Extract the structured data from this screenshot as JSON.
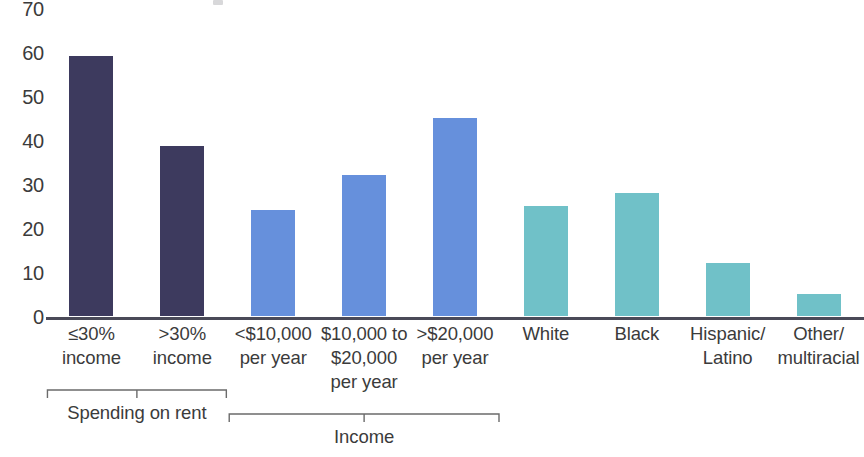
{
  "chart_data": {
    "type": "bar",
    "title": "",
    "xlabel": "",
    "ylabel": "",
    "ylim": [
      0,
      70
    ],
    "ytick_step": 10,
    "grid": false,
    "legend": "none",
    "y_ticks": [
      "70",
      "60",
      "50",
      "40",
      "30",
      "20",
      "10",
      "0"
    ],
    "categories": [
      "≤30%\nincome",
      ">30%\nincome",
      "<$10,000\nper year",
      "$10,000 to\n$20,000\nper year",
      ">$20,000\nper year",
      "White",
      "Black",
      "Hispanic/\nLatino",
      "Other/\nmultiracial"
    ],
    "values": [
      59,
      38.5,
      24,
      32,
      45,
      25,
      28,
      12,
      5
    ],
    "bar_colors": [
      "#3d3a5e",
      "#3d3a5e",
      "#6690dc",
      "#6690dc",
      "#6690dc",
      "#70c1c8",
      "#70c1c8",
      "#70c1c8",
      "#70c1c8"
    ],
    "groups": [
      {
        "label": "Spending on rent",
        "start_index": 0,
        "end_index": 1
      },
      {
        "label": "Income",
        "start_index": 2,
        "end_index": 4
      }
    ],
    "colors": {
      "dark_navy": "#3d3a5e",
      "blue": "#6690dc",
      "teal": "#70c1c8",
      "axis": "#4a4a58",
      "text": "#3b3b3b",
      "background": "#ffffff"
    }
  }
}
